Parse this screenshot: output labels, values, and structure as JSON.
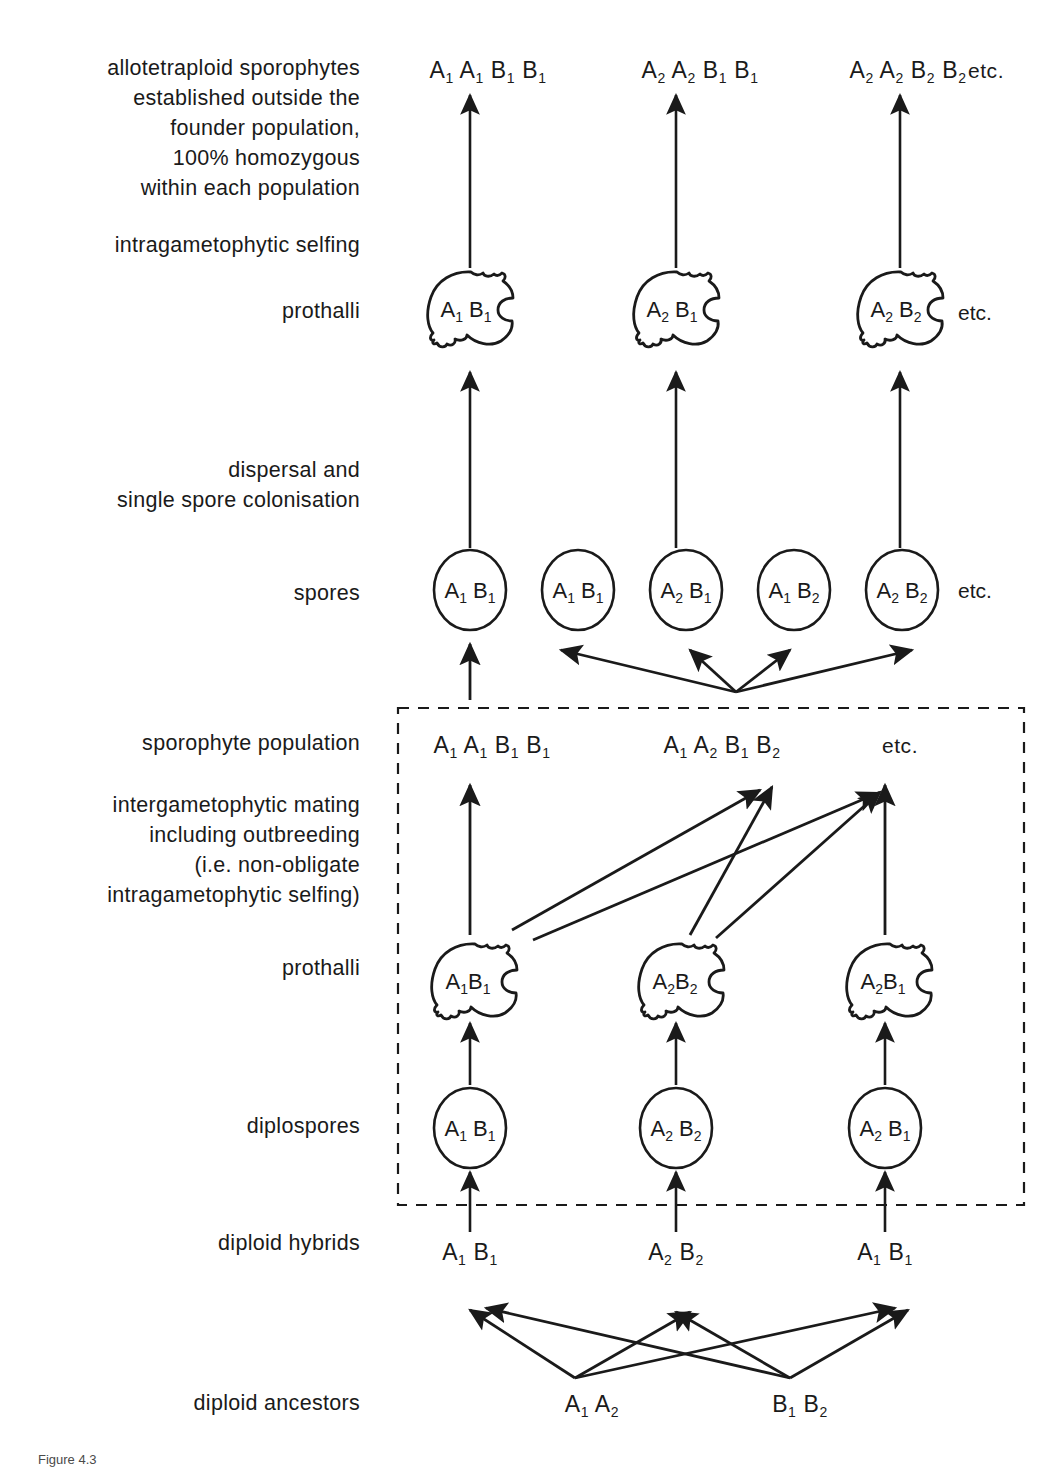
{
  "diagram": {
    "background": "#ffffff",
    "ink": "#1a1a1a",
    "rows": [
      {
        "id": "allotetraploid-sporophytes",
        "label": "allotetraploid sporophytes\nestablished outside the\nfounder population,\n100% homozygous\nwithin each population",
        "label_lines": [
          "allotetraploid  sporophytes",
          "established  outside  the",
          "founder  population,",
          "100%  homozygous",
          "within  each  population"
        ],
        "items": [
          {
            "genotype": "A₁ A₁ B₁ B₁",
            "parts": [
              [
                "A",
                "1"
              ],
              [
                "A",
                "1"
              ],
              [
                "B",
                "1"
              ],
              [
                "B",
                "1"
              ]
            ]
          },
          {
            "genotype": "A₂ A₂ B₁ B₁",
            "parts": [
              [
                "A",
                "2"
              ],
              [
                "A",
                "2"
              ],
              [
                "B",
                "1"
              ],
              [
                "B",
                "1"
              ]
            ]
          },
          {
            "genotype": "A₂ A₂ B₂ B₂",
            "parts": [
              [
                "A",
                "2"
              ],
              [
                "A",
                "2"
              ],
              [
                "B",
                "2"
              ],
              [
                "B",
                "2"
              ]
            ]
          }
        ],
        "trailing": "etc."
      },
      {
        "id": "intragametophytic-selfing",
        "label_lines": [
          "intragametophytic  selfing"
        ],
        "items": []
      },
      {
        "id": "prothalli-upper",
        "label_lines": [
          "prothalli"
        ],
        "shape": "prothallus",
        "items": [
          {
            "genotype": "A₁ B₁",
            "parts": [
              [
                "A",
                "1"
              ],
              [
                "B",
                "1"
              ]
            ]
          },
          {
            "genotype": "A₂ B₁",
            "parts": [
              [
                "A",
                "2"
              ],
              [
                "B",
                "1"
              ]
            ]
          },
          {
            "genotype": "A₂ B₂",
            "parts": [
              [
                "A",
                "2"
              ],
              [
                "B",
                "2"
              ]
            ]
          }
        ],
        "trailing": "etc."
      },
      {
        "id": "dispersal-colonisation",
        "label_lines": [
          "dispersal  and",
          "single  spore  colonisation"
        ],
        "items": []
      },
      {
        "id": "spores",
        "label_lines": [
          "spores"
        ],
        "shape": "circle",
        "items": [
          {
            "genotype": "A₁ B₁",
            "parts": [
              [
                "A",
                "1"
              ],
              [
                "B",
                "1"
              ]
            ]
          },
          {
            "genotype": "A₁ B₁",
            "parts": [
              [
                "A",
                "1"
              ],
              [
                "B",
                "1"
              ]
            ]
          },
          {
            "genotype": "A₂ B₁",
            "parts": [
              [
                "A",
                "2"
              ],
              [
                "B",
                "1"
              ]
            ]
          },
          {
            "genotype": "A₁ B₂",
            "parts": [
              [
                "A",
                "1"
              ],
              [
                "B",
                "2"
              ]
            ]
          },
          {
            "genotype": "A₂ B₂",
            "parts": [
              [
                "A",
                "2"
              ],
              [
                "B",
                "2"
              ]
            ]
          }
        ],
        "trailing": "etc."
      },
      {
        "id": "sporophyte-population",
        "label_lines": [
          "sporophyte  population"
        ],
        "inside_box": true,
        "items": [
          {
            "genotype": "A₁ A₁ B₁ B₁",
            "parts": [
              [
                "A",
                "1"
              ],
              [
                "A",
                "1"
              ],
              [
                "B",
                "1"
              ],
              [
                "B",
                "1"
              ]
            ]
          },
          {
            "genotype": "A₁ A₂ B₁ B₂",
            "parts": [
              [
                "A",
                "1"
              ],
              [
                "A",
                "2"
              ],
              [
                "B",
                "1"
              ],
              [
                "B",
                "2"
              ]
            ]
          }
        ],
        "trailing": "etc."
      },
      {
        "id": "intergametophytic-mating",
        "label_lines": [
          "intergametophytic  mating",
          "including  outbreeding",
          "(i.e.  non-obligate",
          "intragametophytic  selfing)"
        ],
        "inside_box": true,
        "items": []
      },
      {
        "id": "prothalli-lower",
        "label_lines": [
          "prothalli"
        ],
        "shape": "prothallus",
        "inside_box": true,
        "items": [
          {
            "genotype": "A₁B₁",
            "parts": [
              [
                "A",
                "1"
              ],
              [
                "B",
                "1"
              ]
            ]
          },
          {
            "genotype": "A₂B₂",
            "parts": [
              [
                "A",
                "2"
              ],
              [
                "B",
                "2"
              ]
            ]
          },
          {
            "genotype": "A₂B₁",
            "parts": [
              [
                "A",
                "2"
              ],
              [
                "B",
                "1"
              ]
            ]
          }
        ]
      },
      {
        "id": "diplospores",
        "label_lines": [
          "diplospores"
        ],
        "shape": "circle",
        "inside_box": true,
        "items": [
          {
            "genotype": "A₁ B₁",
            "parts": [
              [
                "A",
                "1"
              ],
              [
                "B",
                "1"
              ]
            ]
          },
          {
            "genotype": "A₂ B₂",
            "parts": [
              [
                "A",
                "2"
              ],
              [
                "B",
                "2"
              ]
            ]
          },
          {
            "genotype": "A₂ B₁",
            "parts": [
              [
                "A",
                "2"
              ],
              [
                "B",
                "1"
              ]
            ]
          }
        ]
      },
      {
        "id": "diploid-hybrids",
        "label_lines": [
          "diploid  hybrids"
        ],
        "items": [
          {
            "genotype": "A₁ B₁",
            "parts": [
              [
                "A",
                "1"
              ],
              [
                "B",
                "1"
              ]
            ]
          },
          {
            "genotype": "A₂ B₂",
            "parts": [
              [
                "A",
                "2"
              ],
              [
                "B",
                "2"
              ]
            ]
          },
          {
            "genotype": "A₁ B₁",
            "parts": [
              [
                "A",
                "1"
              ],
              [
                "B",
                "1"
              ]
            ]
          }
        ]
      },
      {
        "id": "diploid-ancestors",
        "label_lines": [
          "diploid  ancestors"
        ],
        "items": [
          {
            "genotype": "A₁ A₂",
            "parts": [
              [
                "A",
                "1"
              ],
              [
                "A",
                "2"
              ]
            ]
          },
          {
            "genotype": "B₁ B₂",
            "parts": [
              [
                "B",
                "1"
              ],
              [
                "B",
                "2"
              ]
            ]
          }
        ]
      }
    ],
    "etc_label": "etc.",
    "founder_box": {
      "style": "dashed",
      "note": "founder population"
    },
    "caption": "Figure 4.3"
  }
}
